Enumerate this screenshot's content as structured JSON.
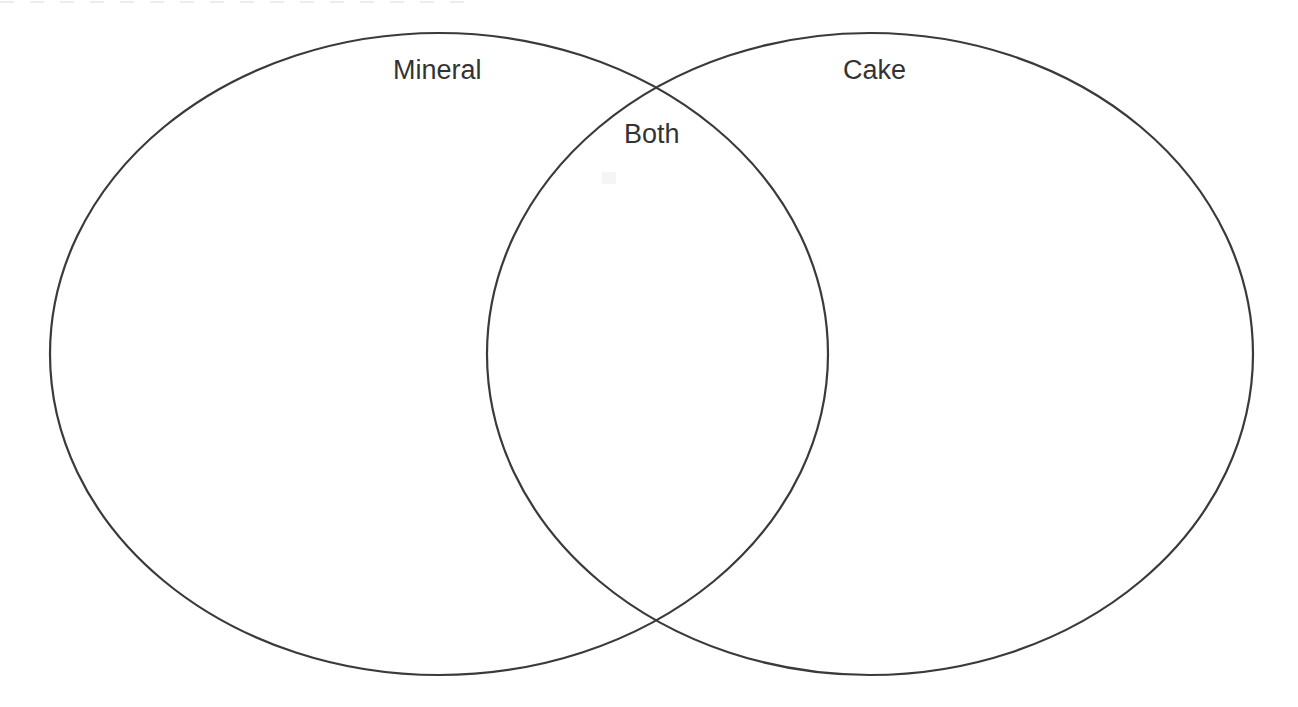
{
  "page": {
    "background_color": "#ffffff",
    "width": 1298,
    "height": 707
  },
  "diagram": {
    "type": "venn",
    "set_count": 2,
    "stroke_color": "#3a3a3a",
    "stroke_width": 2.2,
    "fill": "none",
    "text_color": "#333333",
    "font_size_px": 27,
    "left_set": {
      "label": "Mineral",
      "center_x": 439,
      "center_y": 354,
      "radius_x": 389,
      "radius_y": 321
    },
    "right_set": {
      "label": "Cake",
      "center_x": 870,
      "center_y": 354,
      "radius_x": 383,
      "radius_y": 321
    },
    "intersection": {
      "label": "Both",
      "top_point_x": 658,
      "top_point_y": 90,
      "bottom_point_x": 658,
      "bottom_point_y": 620
    },
    "labels": [
      {
        "id": "left",
        "text": "Mineral",
        "x": 393,
        "y": 57
      },
      {
        "id": "both",
        "text": "Both",
        "x": 624,
        "y": 121
      },
      {
        "id": "right",
        "text": "Cake",
        "x": 843,
        "y": 57
      }
    ],
    "left_region_items": [],
    "right_region_items": [],
    "both_region_items": []
  }
}
